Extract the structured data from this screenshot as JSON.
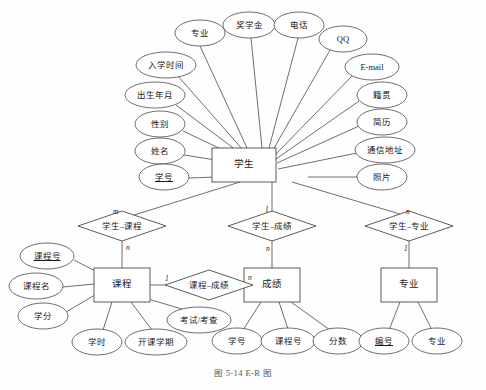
{
  "figure": {
    "caption": "图 5-14   E-R 图",
    "style": {
      "stroke": "#4a4a4a",
      "fill": "#ffffff",
      "text": "#1a1a1a",
      "background": "#fefefe"
    }
  },
  "entities": [
    {
      "id": "student",
      "label": "学生",
      "x": 244,
      "y": 165,
      "w": 64,
      "h": 34
    },
    {
      "id": "course",
      "label": "课程",
      "x": 122,
      "y": 285,
      "w": 56,
      "h": 34
    },
    {
      "id": "grade",
      "label": "成绩",
      "x": 272,
      "y": 285,
      "w": 56,
      "h": 34
    },
    {
      "id": "major",
      "label": "专业",
      "x": 409,
      "y": 285,
      "w": 56,
      "h": 34
    }
  ],
  "relationships": [
    {
      "id": "student-course",
      "label": "学生–课程",
      "x": 122,
      "y": 226,
      "rx": 44,
      "ry": 15
    },
    {
      "id": "student-grade",
      "label": "学生–成绩",
      "x": 272,
      "y": 226,
      "rx": 44,
      "ry": 15
    },
    {
      "id": "course-grade",
      "label": "课程–成绩",
      "x": 209,
      "y": 285,
      "rx": 44,
      "ry": 15
    },
    {
      "id": "student-major",
      "label": "学生–专业",
      "x": 409,
      "y": 226,
      "rx": 44,
      "ry": 15
    }
  ],
  "cardinalities": [
    {
      "id": "card-student-course-top",
      "text": "m",
      "x": 113,
      "y": 207
    },
    {
      "id": "card-student-course-bottom",
      "text": "n",
      "x": 126,
      "y": 243
    },
    {
      "id": "card-student-grade-top",
      "text": "1",
      "x": 265,
      "y": 205
    },
    {
      "id": "card-student-grade-bottom",
      "text": "n",
      "x": 266,
      "y": 244
    },
    {
      "id": "card-student-major-top",
      "text": "n",
      "x": 406,
      "y": 207
    },
    {
      "id": "card-student-major-bottom",
      "text": "1",
      "x": 404,
      "y": 244
    },
    {
      "id": "card-course-grade-left",
      "text": "1",
      "x": 165,
      "y": 274
    },
    {
      "id": "card-course-grade-right",
      "text": "n",
      "x": 248,
      "y": 273
    }
  ],
  "student_attributes": [
    {
      "id": "attr-major-of-student",
      "label": "专业",
      "x": 200,
      "y": 33,
      "rx": 25,
      "ry": 13,
      "key": false
    },
    {
      "id": "attr-enroll-time",
      "label": "入学时间",
      "x": 166,
      "y": 65,
      "rx": 30,
      "ry": 13,
      "key": false
    },
    {
      "id": "attr-birth-date",
      "label": "出生年月",
      "x": 155,
      "y": 95,
      "rx": 30,
      "ry": 13,
      "key": false
    },
    {
      "id": "attr-gender",
      "label": "性别",
      "x": 160,
      "y": 124,
      "rx": 25,
      "ry": 13,
      "key": false
    },
    {
      "id": "attr-name",
      "label": "姓名",
      "x": 160,
      "y": 151,
      "rx": 25,
      "ry": 13,
      "key": false
    },
    {
      "id": "attr-student-no",
      "label": "学号",
      "x": 164,
      "y": 177,
      "rx": 25,
      "ry": 13,
      "key": true
    },
    {
      "id": "attr-scholarship",
      "label": "奖学金",
      "x": 249,
      "y": 25,
      "rx": 26,
      "ry": 13,
      "key": false
    },
    {
      "id": "attr-phone",
      "label": "电话",
      "x": 299,
      "y": 25,
      "rx": 25,
      "ry": 13,
      "key": false
    },
    {
      "id": "attr-qq",
      "label": "QQ",
      "x": 343,
      "y": 39,
      "rx": 24,
      "ry": 13,
      "key": false
    },
    {
      "id": "attr-email",
      "label": "E-mail",
      "x": 372,
      "y": 67,
      "rx": 27,
      "ry": 13,
      "key": false
    },
    {
      "id": "attr-native-place",
      "label": "籍贯",
      "x": 382,
      "y": 95,
      "rx": 25,
      "ry": 13,
      "key": false
    },
    {
      "id": "attr-resume",
      "label": "简历",
      "x": 382,
      "y": 122,
      "rx": 25,
      "ry": 13,
      "key": false
    },
    {
      "id": "attr-address",
      "label": "通信地址",
      "x": 385,
      "y": 150,
      "rx": 30,
      "ry": 13,
      "key": false
    },
    {
      "id": "attr-photo",
      "label": "照片",
      "x": 382,
      "y": 177,
      "rx": 25,
      "ry": 13,
      "key": false
    }
  ],
  "course_attributes": [
    {
      "id": "attr-course-no",
      "label": "课程号",
      "x": 47,
      "y": 256,
      "rx": 27,
      "ry": 13,
      "key": true
    },
    {
      "id": "attr-course-name",
      "label": "课程名",
      "x": 36,
      "y": 286,
      "rx": 27,
      "ry": 13,
      "key": false
    },
    {
      "id": "attr-credit",
      "label": "学分",
      "x": 43,
      "y": 316,
      "rx": 25,
      "ry": 13,
      "key": false
    },
    {
      "id": "attr-class-hours",
      "label": "学时",
      "x": 97,
      "y": 342,
      "rx": 25,
      "ry": 13,
      "key": false
    },
    {
      "id": "attr-open-term",
      "label": "开课学期",
      "x": 156,
      "y": 342,
      "rx": 31,
      "ry": 13,
      "key": false
    },
    {
      "id": "attr-exam-type",
      "label": "考试/考查",
      "x": 199,
      "y": 320,
      "rx": 32,
      "ry": 13,
      "key": false
    }
  ],
  "grade_attributes": [
    {
      "id": "attr-grade-student-no",
      "label": "学号",
      "x": 237,
      "y": 341,
      "rx": 25,
      "ry": 13,
      "key": false
    },
    {
      "id": "attr-grade-course-no",
      "label": "课程号",
      "x": 288,
      "y": 341,
      "rx": 27,
      "ry": 13,
      "key": false
    },
    {
      "id": "attr-score",
      "label": "分数",
      "x": 338,
      "y": 341,
      "rx": 25,
      "ry": 13,
      "key": false
    }
  ],
  "major_attributes": [
    {
      "id": "attr-major-no",
      "label": "编号",
      "x": 384,
      "y": 341,
      "rx": 25,
      "ry": 13,
      "key": true
    },
    {
      "id": "attr-major-name",
      "label": "专业",
      "x": 437,
      "y": 341,
      "rx": 25,
      "ry": 13,
      "key": false
    }
  ],
  "connectors": [
    {
      "id": "line-student-major-attr",
      "x1": 200,
      "y1": 46,
      "x2": 247,
      "y2": 148
    },
    {
      "id": "line-student-enroll-time",
      "x1": 178,
      "y1": 76,
      "x2": 243,
      "y2": 150
    },
    {
      "id": "line-student-birth-date",
      "x1": 176,
      "y1": 105,
      "x2": 240,
      "y2": 153
    },
    {
      "id": "line-student-gender",
      "x1": 183,
      "y1": 131,
      "x2": 240,
      "y2": 158
    },
    {
      "id": "line-student-name",
      "x1": 184,
      "y1": 155,
      "x2": 241,
      "y2": 164
    },
    {
      "id": "line-student-no",
      "x1": 189,
      "y1": 178,
      "x2": 244,
      "y2": 176
    },
    {
      "id": "line-student-scholarship",
      "x1": 251,
      "y1": 38,
      "x2": 262,
      "y2": 148
    },
    {
      "id": "line-student-phone",
      "x1": 298,
      "y1": 38,
      "x2": 269,
      "y2": 148
    },
    {
      "id": "line-student-qq",
      "x1": 330,
      "y1": 50,
      "x2": 273,
      "y2": 150
    },
    {
      "id": "line-student-email",
      "x1": 352,
      "y1": 76,
      "x2": 275,
      "y2": 155
    },
    {
      "id": "line-student-native-place",
      "x1": 359,
      "y1": 101,
      "x2": 276,
      "y2": 159
    },
    {
      "id": "line-student-resume",
      "x1": 359,
      "y1": 126,
      "x2": 277,
      "y2": 163
    },
    {
      "id": "line-student-address",
      "x1": 357,
      "y1": 153,
      "x2": 278,
      "y2": 169
    },
    {
      "id": "line-student-photo",
      "x1": 358,
      "y1": 177,
      "x2": 308,
      "y2": 177
    },
    {
      "id": "line-student-to-sc-rel",
      "x1": 240,
      "y1": 182,
      "x2": 131,
      "y2": 216
    },
    {
      "id": "line-student-to-sg-rel",
      "x1": 272,
      "y1": 182,
      "x2": 272,
      "y2": 212
    },
    {
      "id": "line-student-to-sm-rel",
      "x1": 292,
      "y1": 182,
      "x2": 400,
      "y2": 214
    },
    {
      "id": "line-sc-rel-to-course",
      "x1": 122,
      "y1": 241,
      "x2": 122,
      "y2": 268
    },
    {
      "id": "line-sg-rel-to-grade",
      "x1": 272,
      "y1": 241,
      "x2": 272,
      "y2": 268
    },
    {
      "id": "line-sm-rel-to-major",
      "x1": 409,
      "y1": 241,
      "x2": 409,
      "y2": 268
    },
    {
      "id": "line-course-to-cg-rel",
      "x1": 150,
      "y1": 285,
      "x2": 165,
      "y2": 285
    },
    {
      "id": "line-cg-rel-to-grade",
      "x1": 253,
      "y1": 285,
      "x2": 272,
      "y2": 285
    },
    {
      "id": "line-course-no",
      "x1": 74,
      "y1": 260,
      "x2": 107,
      "y2": 277
    },
    {
      "id": "line-course-name",
      "x1": 63,
      "y1": 287,
      "x2": 94,
      "y2": 284
    },
    {
      "id": "line-credit",
      "x1": 66,
      "y1": 312,
      "x2": 100,
      "y2": 292
    },
    {
      "id": "line-class-hours",
      "x1": 103,
      "y1": 330,
      "x2": 112,
      "y2": 302
    },
    {
      "id": "line-open-term",
      "x1": 152,
      "y1": 330,
      "x2": 131,
      "y2": 302
    },
    {
      "id": "line-exam-type",
      "x1": 185,
      "y1": 310,
      "x2": 145,
      "y2": 298
    },
    {
      "id": "line-grade-student-no",
      "x1": 243,
      "y1": 330,
      "x2": 261,
      "y2": 302
    },
    {
      "id": "line-grade-course-no",
      "x1": 288,
      "y1": 329,
      "x2": 279,
      "y2": 302
    },
    {
      "id": "line-grade-score",
      "x1": 330,
      "y1": 330,
      "x2": 291,
      "y2": 302
    },
    {
      "id": "line-major-no",
      "x1": 389,
      "y1": 330,
      "x2": 400,
      "y2": 302
    },
    {
      "id": "line-major-name",
      "x1": 432,
      "y1": 330,
      "x2": 418,
      "y2": 302
    }
  ]
}
